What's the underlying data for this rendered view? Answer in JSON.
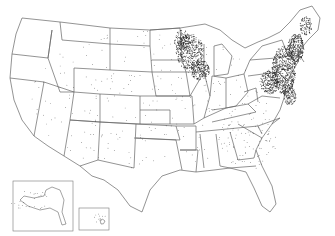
{
  "map": {
    "type": "dot-density",
    "region": "United States",
    "insets": [
      "Alaska",
      "Hawaii"
    ],
    "background": "#ffffff",
    "border_color": "#555555",
    "dot_color": "#1a1a1a",
    "dense_regions": [
      "Upper Midwest (Minnesota, Wisconsin)",
      "Northeast (New York, Pennsylvania, New England)"
    ]
  }
}
